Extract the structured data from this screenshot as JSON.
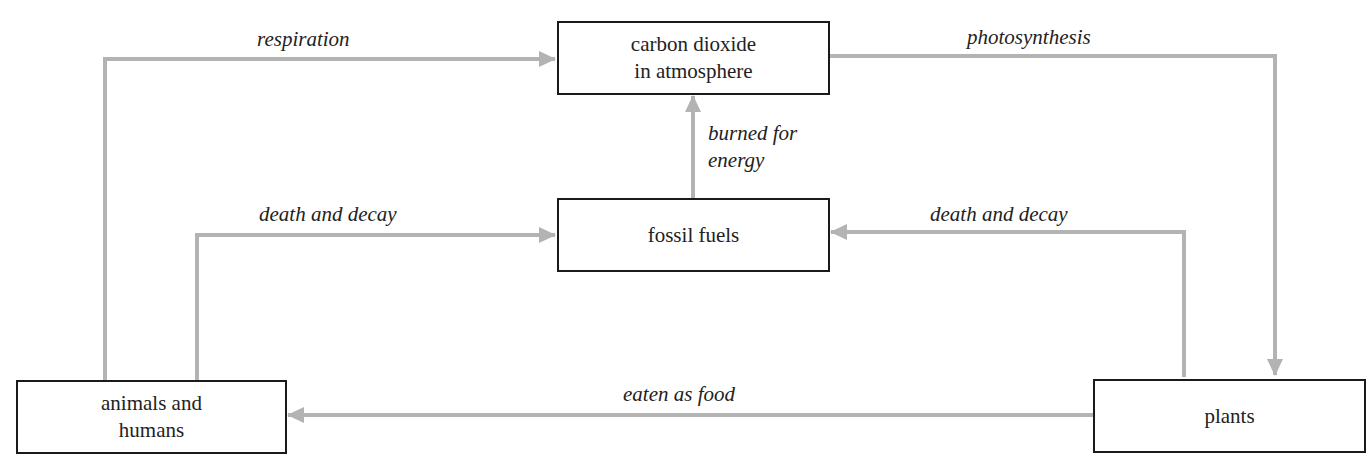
{
  "nodes": {
    "co2": {
      "label": "carbon dioxide\nin atmosphere"
    },
    "fossil": {
      "label": "fossil fuels"
    },
    "animals": {
      "label": "animals and\nhumans"
    },
    "plants": {
      "label": "plants"
    }
  },
  "edges": {
    "respiration": {
      "label": "respiration",
      "from": "animals and humans",
      "to": "carbon dioxide in atmosphere"
    },
    "photosynthesis": {
      "label": "photosynthesis",
      "from": "carbon dioxide in atmosphere",
      "to": "plants"
    },
    "burned": {
      "label": "burned for\nenergy",
      "from": "fossil fuels",
      "to": "carbon dioxide in atmosphere"
    },
    "decay_animals": {
      "label": "death and decay",
      "from": "animals and humans",
      "to": "fossil fuels"
    },
    "decay_plants": {
      "label": "death and decay",
      "from": "plants",
      "to": "fossil fuels"
    },
    "eaten": {
      "label": "eaten as food",
      "from": "plants",
      "to": "animals and humans"
    }
  },
  "colors": {
    "arrow": "#b3b3b3",
    "border": "#1a1a1a",
    "text": "#222222"
  }
}
